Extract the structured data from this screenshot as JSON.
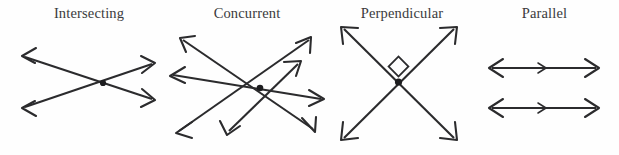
{
  "figure": {
    "title_row": [
      "Intersecting",
      "Concurrent",
      "Perpendicular",
      "Parallel"
    ],
    "background_color": "#fefefe",
    "line_color": "#2b2b2d",
    "label_color": "#3a3a3c",
    "panels": [
      {
        "id": "intersecting",
        "label": "Intersecting",
        "description": "Two straight lines crossing at a single point, arrowheads at all four ends",
        "line_count": 2,
        "arrowhead_count": 4,
        "intersection_points": 1,
        "has_node_dot": true,
        "has_right_angle_mark": false
      },
      {
        "id": "concurrent",
        "label": "Concurrent",
        "description": "Eight rays radiating from one common point",
        "line_count": 4,
        "arrowhead_count": 8,
        "intersection_points": 1,
        "has_node_dot": true,
        "has_right_angle_mark": false
      },
      {
        "id": "perpendicular",
        "label": "Perpendicular",
        "description": "Two lines crossing at a right angle, square marker at the vertex",
        "line_count": 2,
        "arrowhead_count": 4,
        "intersection_points": 1,
        "has_node_dot": true,
        "has_right_angle_mark": true
      },
      {
        "id": "parallel",
        "label": "Parallel",
        "description": "Two horizontal double-headed lines that never meet, each with a centre direction tick",
        "line_count": 2,
        "arrowhead_count": 4,
        "intersection_points": 0,
        "has_node_dot": false,
        "has_right_angle_mark": false
      }
    ]
  }
}
